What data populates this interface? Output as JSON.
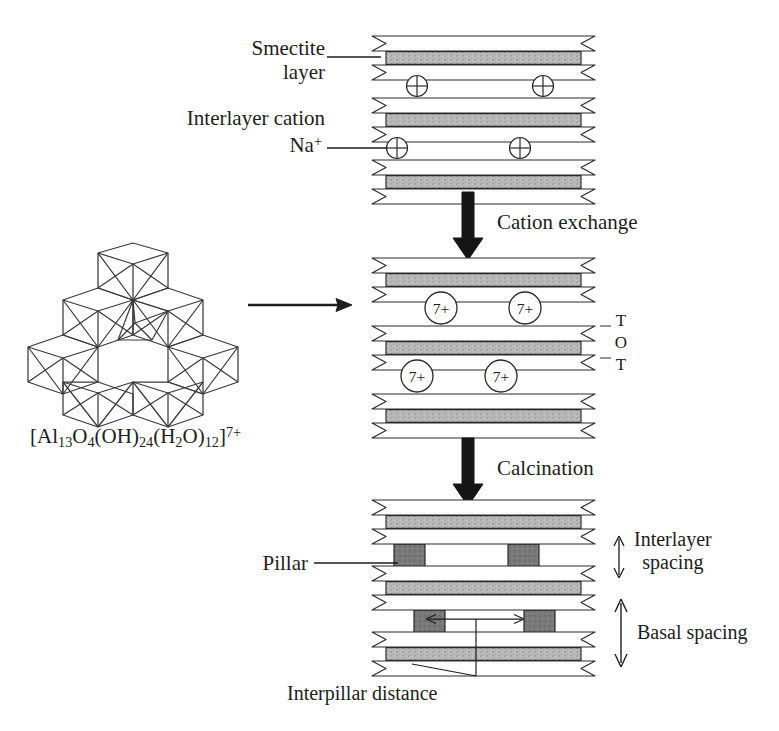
{
  "figure": {
    "background_color": "#ffffff",
    "ink_color": "#1d1d1d"
  },
  "labels": {
    "smectite_layer_line1": "Smectite",
    "smectite_layer_line2": "layer",
    "interlayer_cation": "Interlayer cation",
    "sodium_cation_prefix": "Na",
    "sodium_cation_charge": "+",
    "cation_exchange": "Cation exchange",
    "calcination": "Calcination",
    "pillar": "Pillar",
    "interlayer_spacing_line1": "Interlayer",
    "interlayer_spacing_line2": "spacing",
    "basal_spacing": "Basal spacing",
    "interpillar_distance": "Interpillar distance",
    "tot_letters": [
      "T",
      "O",
      "T"
    ]
  },
  "keggin": {
    "formula_plain": "[Al13O4(OH)24(H2O)12]7+",
    "formula_parts": [
      {
        "t": "[Al",
        "k": "n"
      },
      {
        "t": "13",
        "k": "sub"
      },
      {
        "t": "O",
        "k": "n"
      },
      {
        "t": "4",
        "k": "sub"
      },
      {
        "t": "(OH)",
        "k": "n"
      },
      {
        "t": "24",
        "k": "sub"
      },
      {
        "t": "(H",
        "k": "n"
      },
      {
        "t": "2",
        "k": "sub"
      },
      {
        "t": "O)",
        "k": "n"
      },
      {
        "t": "12",
        "k": "sub"
      },
      {
        "t": "]",
        "k": "n"
      },
      {
        "t": "7+",
        "k": "sup"
      }
    ]
  },
  "charges": {
    "sodium_symbol": "⊕",
    "keggin_charge_label": "7+"
  },
  "colors": {
    "layer_fill_outer": "#ffffff",
    "layer_fill_inner": "#b6b6b6",
    "layer_stroke": "#2a2a2a",
    "pillar_fill": "#7a7a7a",
    "pillar_stroke": "#2a2a2a",
    "arrow_thick": "#1a1a1a",
    "arrow_thin": "#1d1d1d"
  },
  "stages": [
    {
      "name": "smectite-na",
      "layer_count": 3,
      "interlayer_species": "Na+",
      "interlayer_marker_count": 4
    },
    {
      "name": "keggin-exchanged",
      "layer_count": 3,
      "interlayer_species": "[Al13]7+",
      "interlayer_marker_count": 4
    },
    {
      "name": "pillared-calcined",
      "layer_count": 3,
      "pillar_count": 4
    }
  ]
}
